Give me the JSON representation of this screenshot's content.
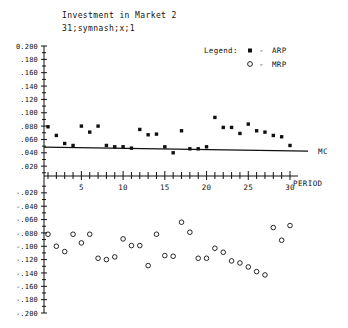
{
  "chart_data": {
    "type": "scatter",
    "title": "Investment in Market 2",
    "subtitle": "31;symnash;x;1",
    "xlabel": "PERIOD",
    "ylabel": "",
    "xlim": [
      0,
      31
    ],
    "ylim": [
      -0.2,
      0.2
    ],
    "grid": false,
    "legend": {
      "title": "Legend:",
      "position": "top-right",
      "entries": [
        {
          "marker": "filled-square",
          "dash": "-",
          "name": "ARP"
        },
        {
          "marker": "open-circle",
          "dash": "-",
          "name": "MRP"
        }
      ]
    },
    "y_ticklabels": [
      "0.200",
      ".180",
      ".160",
      ".140",
      ".120",
      ".100",
      ".080",
      ".060",
      ".040",
      ".020",
      "-.020",
      "-.040",
      "-.060",
      "-.080",
      "-.100",
      "-.120",
      "-.140",
      "-.160",
      "-.180",
      "-.200"
    ],
    "y_tickvalues": [
      0.2,
      0.18,
      0.16,
      0.14,
      0.12,
      0.1,
      0.08,
      0.06,
      0.04,
      0.02,
      -0.02,
      -0.04,
      -0.06,
      -0.08,
      -0.1,
      -0.12,
      -0.14,
      -0.16,
      -0.18,
      -0.2
    ],
    "x_ticklabels": [
      "5",
      "10",
      "15",
      "20",
      "25",
      "30"
    ],
    "x_tickvalues": [
      5,
      10,
      15,
      20,
      25,
      30
    ],
    "x_minor_ticks": [
      1,
      2,
      3,
      4,
      5,
      6,
      7,
      8,
      9,
      10,
      11,
      12,
      13,
      14,
      15,
      16,
      17,
      18,
      19,
      20,
      21,
      22,
      23,
      24,
      25,
      26,
      27,
      28,
      29,
      30
    ],
    "annotations": [
      {
        "text": "MC",
        "x": 31.2,
        "y": 0.043
      }
    ],
    "series": [
      {
        "name": "ARP",
        "marker": "filled-square",
        "x": [
          1,
          2,
          3,
          4,
          5,
          6,
          7,
          8,
          9,
          10,
          11,
          12,
          13,
          14,
          15,
          16,
          17,
          18,
          19,
          20,
          21,
          22,
          23,
          24,
          25,
          26,
          27,
          28,
          29,
          30
        ],
        "values": [
          0.079,
          0.066,
          0.054,
          0.051,
          0.08,
          0.071,
          0.08,
          0.051,
          0.049,
          0.049,
          0.047,
          0.075,
          0.067,
          0.068,
          0.049,
          0.04,
          0.073,
          0.046,
          0.046,
          0.049,
          0.093,
          0.078,
          0.078,
          0.069,
          0.083,
          0.073,
          0.071,
          0.066,
          0.064,
          0.051
        ]
      },
      {
        "name": "MRP",
        "marker": "open-circle",
        "x": [
          1,
          2,
          3,
          4,
          5,
          6,
          7,
          8,
          9,
          10,
          11,
          12,
          13,
          14,
          15,
          16,
          17,
          18,
          19,
          20,
          21,
          22,
          23,
          24,
          25,
          26,
          27,
          28,
          29,
          30
        ],
        "values": [
          -0.082,
          -0.1,
          -0.108,
          -0.082,
          -0.095,
          -0.082,
          -0.118,
          -0.12,
          -0.116,
          -0.089,
          -0.099,
          -0.099,
          -0.129,
          -0.082,
          -0.114,
          -0.115,
          -0.064,
          -0.079,
          -0.118,
          -0.118,
          -0.103,
          -0.109,
          -0.122,
          -0.125,
          -0.131,
          -0.138,
          -0.143,
          -0.072,
          -0.091,
          -0.069
        ]
      }
    ],
    "mc_line": {
      "name": "MC",
      "x": [
        1,
        30
      ],
      "values": [
        0.0485,
        0.0425
      ]
    }
  }
}
